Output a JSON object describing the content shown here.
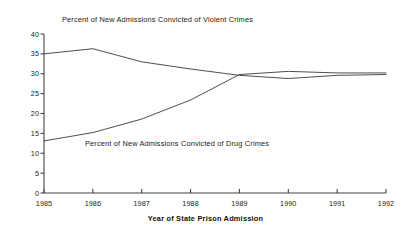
{
  "chart_data": {
    "type": "line",
    "title": "",
    "xlabel": "Year of State Prison Admission",
    "ylabel": "",
    "x": [
      1985,
      1986,
      1987,
      1988,
      1989,
      1990,
      1991,
      1992
    ],
    "categories": [
      "1985",
      "1986",
      "1987",
      "1988",
      "1989",
      "1990",
      "1991",
      "1992"
    ],
    "xlim": [
      1985,
      1992
    ],
    "ylim": [
      0,
      40
    ],
    "yticks": [
      0,
      5,
      10,
      15,
      20,
      25,
      30,
      35,
      40
    ],
    "ytick_labels": [
      "0",
      "5",
      "10",
      "15",
      "20",
      "25",
      "30",
      "35",
      "40"
    ],
    "grid": false,
    "legend": "inline-annotations",
    "line_color": "#3a3a3a",
    "axis_color": "#444444",
    "series": [
      {
        "name": "Percent of New Admissions Convicted of Violent Crimes",
        "values": [
          35.0,
          36.3,
          33.0,
          31.2,
          29.6,
          28.8,
          29.6,
          29.8
        ],
        "label_x": 1986.0,
        "label_y": 39.0
      },
      {
        "name": "Percent of New Admissions Convicted of Drug Crimes",
        "values": [
          13.1,
          15.2,
          18.6,
          23.4,
          29.8,
          30.6,
          30.2,
          30.2
        ],
        "label_x": 1986.7,
        "label_y": 10.8
      }
    ],
    "annotations": [
      {
        "text": "Percent of New Admissions Convicted of Violent Crimes",
        "x_px": 62,
        "y_px": 15
      },
      {
        "text": "Percent of New Admissions Convicted of Drug Crimes",
        "x_px": 85,
        "y_px": 139
      }
    ]
  }
}
